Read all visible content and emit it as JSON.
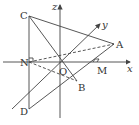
{
  "diagram": {
    "type": "3d-coordinate-geometry",
    "axes": {
      "x": {
        "label": "x"
      },
      "y": {
        "label": "y"
      },
      "z": {
        "label": "z"
      }
    },
    "points": {
      "A": {
        "label": "A"
      },
      "B": {
        "label": "B"
      },
      "C": {
        "label": "C"
      },
      "D": {
        "label": "D"
      },
      "M": {
        "label": "M"
      },
      "N": {
        "label": "N"
      },
      "O": {
        "label": "O"
      }
    },
    "colors": {
      "line": "#444444",
      "text": "#333333",
      "background": "#ffffff"
    }
  }
}
